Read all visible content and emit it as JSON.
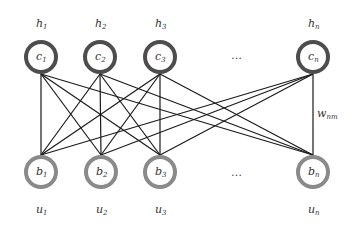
{
  "diagram": {
    "type": "bipartite-network",
    "top_layer": {
      "nodes": [
        {
          "id": "c1",
          "base": "c",
          "sub": "1",
          "label_base": "h",
          "label_sub": "1",
          "x": 41
        },
        {
          "id": "c2",
          "base": "c",
          "sub": "2",
          "label_base": "h",
          "label_sub": "2",
          "x": 100
        },
        {
          "id": "c3",
          "base": "c",
          "sub": "3",
          "label_base": "h",
          "label_sub": "3",
          "x": 160
        },
        {
          "id": "cn",
          "base": "c",
          "sub": "n",
          "label_base": "h",
          "label_sub": "n",
          "x": 313
        }
      ],
      "y": 57,
      "stroke_color": "#4d4d4d"
    },
    "bottom_layer": {
      "nodes": [
        {
          "id": "b1",
          "base": "b",
          "sub": "1",
          "label_base": "u",
          "label_sub": "1",
          "x": 41
        },
        {
          "id": "b2",
          "base": "b",
          "sub": "2",
          "label_base": "u",
          "label_sub": "2",
          "x": 101
        },
        {
          "id": "b3",
          "base": "b",
          "sub": "3",
          "label_base": "u",
          "label_sub": "3",
          "x": 160
        },
        {
          "id": "bn",
          "base": "b",
          "sub": "n",
          "label_base": "u",
          "label_sub": "n",
          "x": 313
        }
      ],
      "y": 172,
      "stroke_color": "#8a8a8a"
    },
    "ellipsis": "…",
    "edge_label": {
      "base": "w",
      "sub": "nm"
    },
    "connectivity": "fully-connected"
  }
}
